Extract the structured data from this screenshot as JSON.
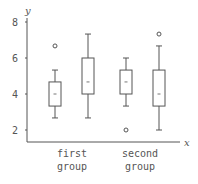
{
  "chart_data": {
    "type": "boxplot",
    "title": "",
    "xlabel": "x",
    "ylabel": "y",
    "ylim": [
      1.5,
      8
    ],
    "yticks": [
      2,
      4,
      6,
      8
    ],
    "grid": false,
    "categories": [
      "first group",
      "second group"
    ],
    "group_labels": [
      {
        "line1": "first",
        "line2": "group"
      },
      {
        "line1": "second",
        "line2": "group"
      }
    ],
    "boxes": [
      {
        "group": "first group",
        "whisker_low": 2.67,
        "q1": 3.33,
        "median": 4.0,
        "q3": 4.67,
        "whisker_high": 5.33,
        "outliers": [
          6.67
        ]
      },
      {
        "group": "first group",
        "whisker_low": 2.67,
        "q1": 4.0,
        "median": 4.67,
        "q3": 6.0,
        "whisker_high": 7.33,
        "outliers": []
      },
      {
        "group": "second group",
        "whisker_low": 3.33,
        "q1": 4.0,
        "median": 4.67,
        "q3": 5.33,
        "whisker_high": 6.0,
        "outliers": [
          2.0
        ]
      },
      {
        "group": "second group",
        "whisker_low": 2.0,
        "q1": 3.33,
        "median": 4.0,
        "q3": 5.33,
        "whisker_high": 6.67,
        "outliers": [
          7.33
        ]
      }
    ],
    "colors": {
      "stroke": "#555555",
      "median": "#777777"
    }
  }
}
